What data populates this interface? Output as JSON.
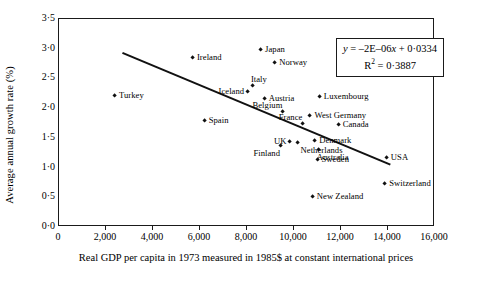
{
  "chart_data": {
    "type": "scatter",
    "title": "",
    "xlabel": "Real GDP per capita in 1973 measured in 1985$ at constant international prices",
    "ylabel": "Average annual growth rate (%)",
    "xlim": [
      0,
      16000
    ],
    "ylim": [
      0.0,
      3.5
    ],
    "grid": false,
    "legend": "none",
    "xticks": [
      "0",
      "2,000",
      "4,000",
      "6,000",
      "8,000",
      "10,000",
      "12,000",
      "14,000",
      "16,000"
    ],
    "xtick_values": [
      0,
      2000,
      4000,
      6000,
      8000,
      10000,
      12000,
      14000,
      16000
    ],
    "yticks": [
      "0·0",
      "0·5",
      "1·0",
      "1·5",
      "2·0",
      "2·5",
      "3·0",
      "3·5"
    ],
    "ytick_values": [
      0.0,
      0.5,
      1.0,
      1.5,
      2.0,
      2.5,
      3.0,
      3.5
    ],
    "annotations": {
      "equation": "y = –2E–06x + 0·0334",
      "r_squared": "R² = 0·3887",
      "equation_parts": {
        "y": "y",
        "body": " = –2E–06",
        "x": "x",
        "tail": " + 0·0334"
      },
      "r_squared_parts": {
        "r": "R",
        "exp": "2",
        "tail": " = 0·3887"
      }
    },
    "trendline": {
      "slope": -0.0002,
      "intercept": 3.34,
      "x_start": 2700,
      "y_start": 2.93,
      "x_end": 14100,
      "y_end": 1.05
    },
    "points": [
      {
        "label": "Turkey",
        "x": 2380,
        "y": 2.21,
        "label_pos": "right"
      },
      {
        "label": "Ireland",
        "x": 5700,
        "y": 2.85,
        "label_pos": "right"
      },
      {
        "label": "Spain",
        "x": 6200,
        "y": 1.78,
        "label_pos": "right"
      },
      {
        "label": "Iceland",
        "x": 8050,
        "y": 2.28,
        "label_pos": "left"
      },
      {
        "label": "Italy",
        "x": 8250,
        "y": 2.38,
        "label_pos": "above"
      },
      {
        "label": "Japan",
        "x": 8600,
        "y": 2.97,
        "label_pos": "right"
      },
      {
        "label": "Austria",
        "x": 8750,
        "y": 2.16,
        "label_pos": "right"
      },
      {
        "label": "Norway",
        "x": 9200,
        "y": 2.76,
        "label_pos": "right"
      },
      {
        "label": "Belgium",
        "x": 9550,
        "y": 1.93,
        "label_pos": "aboveL"
      },
      {
        "label": "Finland",
        "x": 9450,
        "y": 1.36,
        "label_pos": "belowL"
      },
      {
        "label": "UK",
        "x": 9850,
        "y": 1.43,
        "label_pos": "left"
      },
      {
        "label": "Netherlands",
        "x": 10150,
        "y": 1.42,
        "label_pos": "belowR"
      },
      {
        "label": "France",
        "x": 10400,
        "y": 1.73,
        "label_pos": "aboveL"
      },
      {
        "label": "West Germany",
        "x": 10700,
        "y": 1.86,
        "label_pos": "right"
      },
      {
        "label": "New Zealand",
        "x": 10800,
        "y": 0.5,
        "label_pos": "right"
      },
      {
        "label": "Denmark",
        "x": 10900,
        "y": 1.44,
        "label_pos": "right"
      },
      {
        "label": "Sweden",
        "x": 11000,
        "y": 1.13,
        "label_pos": "right"
      },
      {
        "label": "Australia",
        "x": 11050,
        "y": 1.29,
        "label_pos": "below"
      },
      {
        "label": "Luxembourg",
        "x": 11100,
        "y": 2.19,
        "label_pos": "right"
      },
      {
        "label": "Canada",
        "x": 11900,
        "y": 1.71,
        "label_pos": "right"
      },
      {
        "label": "Switzerland",
        "x": 13880,
        "y": 0.72,
        "label_pos": "right"
      },
      {
        "label": "USA",
        "x": 13950,
        "y": 1.16,
        "label_pos": "right"
      }
    ]
  }
}
